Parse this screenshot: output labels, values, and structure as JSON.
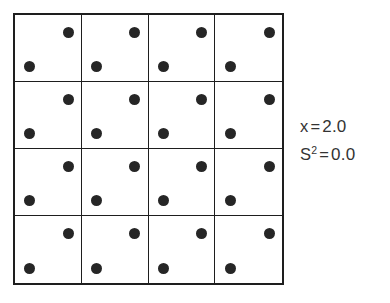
{
  "figure": {
    "name": "dot-grid-variance-diagram",
    "grid": {
      "rows": 4,
      "cols": 4,
      "dots_per_cell": 2,
      "dot_positions": [
        "upper-right",
        "lower-left"
      ],
      "line_color": "#1e1e1e",
      "dot_color": "#262626",
      "background_color": "#ffffff"
    }
  },
  "stats": {
    "mean": {
      "symbol": "x",
      "equals": "=",
      "value": "2.0"
    },
    "variance": {
      "symbol": "S",
      "exponent": "2",
      "equals": "=",
      "value": "0.0"
    }
  },
  "chart_data": {
    "type": "heatmap",
    "title": "",
    "xlabel": "",
    "ylabel": "",
    "categories": [
      "C1",
      "C2",
      "C3",
      "C4"
    ],
    "rows": [
      "R1",
      "R2",
      "R3",
      "R4"
    ],
    "values": [
      [
        2,
        2,
        2,
        2
      ],
      [
        2,
        2,
        2,
        2
      ],
      [
        2,
        2,
        2,
        2
      ],
      [
        2,
        2,
        2,
        2
      ]
    ],
    "annotations": [
      "x = 2.0",
      "S² = 0.0"
    ]
  }
}
